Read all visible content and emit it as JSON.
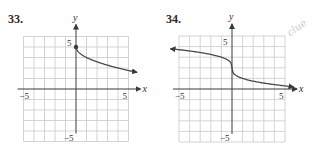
{
  "problems": [
    {
      "number": "33.",
      "x_axis_label": "x",
      "y_axis_label": "y",
      "tick_labels": {
        "x_min": "−5",
        "x_max": "5",
        "y_max": "5",
        "y_min": "−5"
      }
    },
    {
      "number": "34.",
      "x_axis_label": "x",
      "y_axis_label": "y",
      "tick_labels": {
        "x_min": "−5",
        "x_max": "5",
        "y_max": "5",
        "y_min": "−5"
      }
    }
  ],
  "margin_note": "clue",
  "chart_data": [
    {
      "type": "line",
      "title": "33.",
      "xlabel": "x",
      "ylabel": "y",
      "xlim": [
        -5,
        5
      ],
      "ylim": [
        -5,
        5
      ],
      "grid": true,
      "series": [
        {
          "name": "y = -sqrt(x) + 4",
          "x": [
            0,
            0.5,
            1,
            2,
            3,
            4,
            5,
            5.8
          ],
          "y": [
            4,
            3.29,
            3,
            2.59,
            2.27,
            2,
            1.76,
            1.59
          ],
          "start_point": [
            0,
            4
          ],
          "start_marker": "filled-dot",
          "end_marker": "arrow"
        }
      ]
    },
    {
      "type": "line",
      "title": "34.",
      "xlabel": "x",
      "ylabel": "y",
      "xlim": [
        -5,
        5
      ],
      "ylim": [
        -5,
        5
      ],
      "grid": true,
      "series": [
        {
          "name": "y = -cbrt(x) + 2",
          "x": [
            -5.8,
            -5,
            -4,
            -3,
            -2,
            -1,
            -0.3,
            0,
            0.3,
            1,
            2,
            3,
            4,
            5,
            5.8
          ],
          "y": [
            3.8,
            3.71,
            3.59,
            3.44,
            3.26,
            3,
            2.67,
            2,
            1.33,
            1,
            0.74,
            0.56,
            0.41,
            0.29,
            0.2
          ],
          "start_marker": "arrow",
          "end_marker": "arrow"
        }
      ]
    }
  ]
}
